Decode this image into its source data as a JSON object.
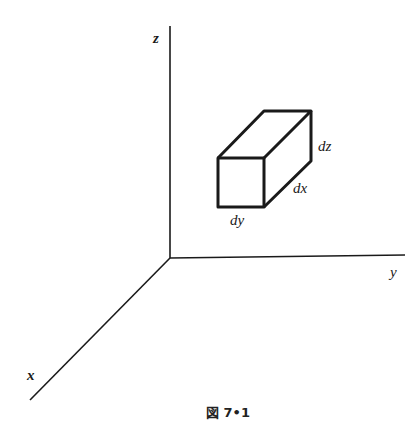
{
  "figure": {
    "type": "3d-axes-with-volume-element",
    "axes": {
      "x_label": "x",
      "y_label": "y",
      "z_label": "z"
    },
    "box": {
      "edge_x_label": "dx",
      "edge_y_label": "dy",
      "edge_z_label": "dz"
    },
    "caption": "図 7•1"
  }
}
